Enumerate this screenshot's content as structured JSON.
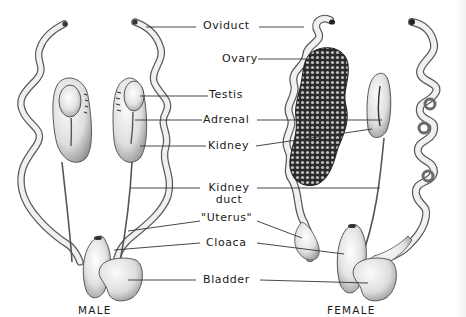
{
  "diagram": {
    "type": "anatomical-comparison",
    "labels": [
      {
        "id": "oviduct",
        "text": "Oviduct"
      },
      {
        "id": "ovary",
        "text": "Ovary"
      },
      {
        "id": "testis",
        "text": "Testis"
      },
      {
        "id": "adrenal",
        "text": "Adrenal"
      },
      {
        "id": "kidney",
        "text": "Kidney"
      },
      {
        "id": "kidney_duct_1",
        "text": "Kidney"
      },
      {
        "id": "kidney_duct_2",
        "text": "duct"
      },
      {
        "id": "uterus",
        "text": "\"Uterus\""
      },
      {
        "id": "cloaca",
        "text": "Cloaca"
      },
      {
        "id": "bladder",
        "text": "Bladder"
      }
    ],
    "captions": {
      "male": "MALE",
      "female": "FEMALE"
    },
    "colors": {
      "background": "#ffffff",
      "organ_light": "#f4f4f4",
      "organ_shade": "#9a9a9a",
      "outline": "#3a3a3a",
      "ovary_dark": "#2b2b2b",
      "leader_line": "#333333"
    }
  }
}
